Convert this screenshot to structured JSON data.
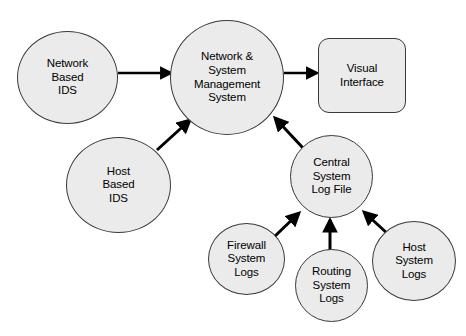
{
  "diagram": {
    "background_color": "#ffffff",
    "node_fill_color": "#ebebeb",
    "node_stroke_color": "#3a3a3a",
    "edge_color": "#000000",
    "nodes": [
      {
        "id": "network-based-ids",
        "label": "Network\nBased\nIDS",
        "shape": "circle",
        "x": 17,
        "y": 31,
        "width": 101,
        "height": 93,
        "font_size": 11.5
      },
      {
        "id": "network-system-management-system",
        "label": "Network &\nSystem\nManagement\nSystem",
        "shape": "circle",
        "x": 170,
        "y": 20,
        "width": 114,
        "height": 115,
        "font_size": 11.5
      },
      {
        "id": "visual-interface",
        "label": "Visual\nInterface",
        "shape": "rounded-rect",
        "x": 318,
        "y": 38,
        "width": 88,
        "height": 75,
        "font_size": 11.5
      },
      {
        "id": "host-based-ids",
        "label": "Host\nBased\nIDS",
        "shape": "circle",
        "x": 66,
        "y": 137,
        "width": 105,
        "height": 96,
        "font_size": 11.5
      },
      {
        "id": "central-system-log-file",
        "label": "Central\nSystem\nLog File",
        "shape": "circle",
        "x": 290,
        "y": 135,
        "width": 83,
        "height": 83,
        "font_size": 11.5
      },
      {
        "id": "firewall-system-logs",
        "label": "Firewall\nSystem\nLogs",
        "shape": "circle",
        "x": 208,
        "y": 223,
        "width": 77,
        "height": 72,
        "font_size": 11.5
      },
      {
        "id": "routing-system-logs",
        "label": "Routing\nSystem\nLogs",
        "shape": "circle",
        "x": 295,
        "y": 249,
        "width": 73,
        "height": 73,
        "font_size": 11.5
      },
      {
        "id": "host-system-logs",
        "label": "Host\nSystem\nLogs",
        "shape": "circle",
        "x": 372,
        "y": 221,
        "width": 84,
        "height": 80,
        "font_size": 11.5
      }
    ],
    "edges": [
      {
        "id": "edge-network-ids-to-management",
        "from": "network-based-ids",
        "to": "network-system-management-system",
        "x1": 118,
        "y1": 73,
        "x2": 171,
        "y2": 73,
        "stroke_width": 2.6
      },
      {
        "id": "edge-management-to-visual-interface",
        "from": "network-system-management-system",
        "to": "visual-interface",
        "x1": 284,
        "y1": 73,
        "x2": 317,
        "y2": 73,
        "stroke_width": 2.6
      },
      {
        "id": "edge-host-ids-to-management",
        "from": "host-based-ids",
        "to": "network-system-management-system",
        "x1": 157,
        "y1": 150,
        "x2": 190,
        "y2": 120,
        "stroke_width": 3.0
      },
      {
        "id": "edge-log-file-to-management",
        "from": "central-system-log-file",
        "to": "network-system-management-system",
        "x1": 303,
        "y1": 148,
        "x2": 275,
        "y2": 118,
        "stroke_width": 3.0
      },
      {
        "id": "edge-firewall-logs-to-log-file",
        "from": "firewall-system-logs",
        "to": "central-system-log-file",
        "x1": 274,
        "y1": 237,
        "x2": 299,
        "y2": 213,
        "stroke_width": 3.0
      },
      {
        "id": "edge-routing-logs-to-log-file",
        "from": "routing-system-logs",
        "to": "central-system-log-file",
        "x1": 330,
        "y1": 250,
        "x2": 330,
        "y2": 220,
        "stroke_width": 3.0
      },
      {
        "id": "edge-host-logs-to-log-file",
        "from": "host-system-logs",
        "to": "central-system-log-file",
        "x1": 389,
        "y1": 235,
        "x2": 364,
        "y2": 212,
        "stroke_width": 3.0
      }
    ]
  }
}
